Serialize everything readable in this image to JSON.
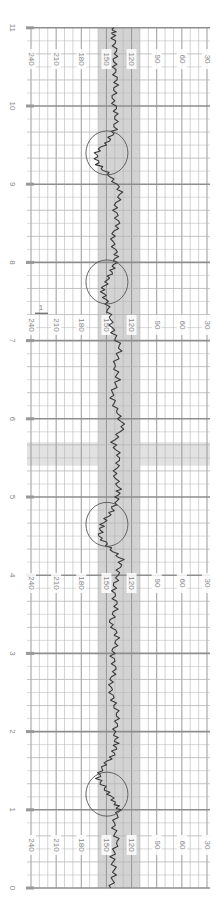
{
  "chart_data": {
    "type": "line",
    "title": "",
    "orientation": "rotated-90 (time runs bottom to top)",
    "xlabel": "Time (minutes)",
    "ylabel": "Fetal heart rate (bpm)",
    "time_ticks": [
      "0",
      "1",
      "2",
      "3",
      "4",
      "5",
      "6",
      "7",
      "8",
      "9",
      "10",
      "11"
    ],
    "bpm_ticks": [
      "240",
      "210",
      "180",
      "150",
      "120",
      "90",
      "60",
      "30"
    ],
    "bpm_label_rows_minutes": [
      0.55,
      3.9,
      7.2,
      10.6
    ],
    "ylim": [
      30,
      240
    ],
    "xlim": [
      0,
      11
    ],
    "grid": true,
    "normal_band_bpm": [
      110,
      160
    ],
    "marker_label": "1",
    "marker_minute": 7.35,
    "highlight_rows_minutes": [
      5.4,
      5.7
    ],
    "series": [
      {
        "name": "FHR",
        "x": [
          0,
          0.2,
          0.4,
          0.6,
          0.8,
          1.0,
          1.1,
          1.25,
          1.4,
          1.55,
          1.7,
          1.85,
          2.0,
          2.2,
          2.4,
          2.6,
          2.8,
          3.0,
          3.2,
          3.4,
          3.6,
          3.8,
          4.0,
          4.2,
          4.35,
          4.5,
          4.65,
          4.8,
          4.95,
          5.1,
          5.3,
          5.5,
          5.7,
          5.9,
          6.1,
          6.3,
          6.5,
          6.7,
          6.9,
          7.1,
          7.3,
          7.5,
          7.65,
          7.8,
          7.95,
          8.1,
          8.3,
          8.5,
          8.7,
          8.9,
          9.1,
          9.25,
          9.4,
          9.55,
          9.7,
          9.9,
          10.1,
          10.3,
          10.5,
          10.7,
          10.9,
          11.0
        ],
        "values": [
          145,
          140,
          143,
          137,
          142,
          135,
          140,
          150,
          160,
          155,
          142,
          138,
          140,
          136,
          142,
          146,
          140,
          143,
          136,
          145,
          138,
          142,
          137,
          132,
          146,
          158,
          155,
          145,
          138,
          135,
          140,
          134,
          142,
          130,
          138,
          144,
          136,
          140,
          133,
          142,
          146,
          150,
          155,
          147,
          141,
          138,
          144,
          136,
          140,
          132,
          145,
          160,
          163,
          148,
          140,
          138,
          142,
          138,
          141,
          139,
          142,
          141
        ]
      }
    ],
    "annotations": [
      {
        "type": "circle",
        "label": "acceleration",
        "minute_center": 1.2,
        "bpm_center": 150
      },
      {
        "type": "circle",
        "label": "acceleration",
        "minute_center": 4.65,
        "bpm_center": 150
      },
      {
        "type": "circle",
        "label": "acceleration",
        "minute_center": 7.75,
        "bpm_center": 150
      },
      {
        "type": "circle",
        "label": "acceleration",
        "minute_center": 9.4,
        "bpm_center": 150
      }
    ]
  },
  "colors": {
    "grid_minor": "#b5b5b5",
    "grid_major": "#8e8e8e",
    "normal_band": "#d3d3d3",
    "trace": "#3a3a3a",
    "circle": "#555555",
    "label": "#8a8a8a",
    "highlight_band": "#e2e2e2"
  }
}
